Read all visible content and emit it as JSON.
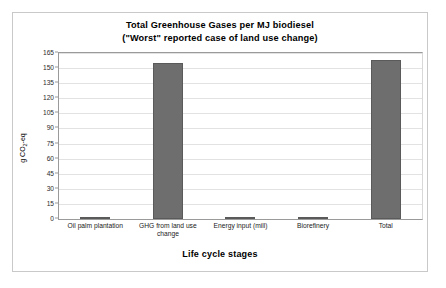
{
  "chart_data": {
    "type": "bar",
    "title": "Total Greenhouse Gases per MJ biodiesel",
    "subtitle": "(\"Worst\" reported case of land use change)",
    "title_lines": [
      "Total Greenhouse Gases per MJ biodiesel",
      "(\"Worst\" reported case of land use change)"
    ],
    "xlabel": "Life cycle stages",
    "ylabel": "g CO2-eq",
    "ylabel_parts": {
      "pre": "g CO",
      "sub": "2",
      "post": "-eq"
    },
    "categories": [
      "Oil palm plantation",
      "GHG from land use change",
      "Energy input (mill)",
      "Biorefinery",
      "Total"
    ],
    "values": [
      2.5,
      155,
      0.5,
      2.5,
      158
    ],
    "ylim": [
      0,
      165
    ],
    "yticks": [
      0,
      15,
      30,
      45,
      60,
      75,
      90,
      105,
      120,
      135,
      150,
      165
    ],
    "ytick_labels": [
      "0",
      "15",
      "30",
      "45",
      "60",
      "75",
      "90",
      "105",
      "120",
      "135",
      "150",
      "165"
    ],
    "grid": true,
    "legend": "none",
    "bar_color": "#6e6e6e",
    "bar_border_color": "#5a5a5a",
    "grid_color": "#e2e2e2",
    "axis_color": "#9a9a9a",
    "frame_color": "#c9c9c9",
    "background": "#ffffff"
  }
}
